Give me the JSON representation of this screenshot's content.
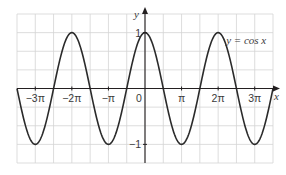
{
  "chart_data": {
    "type": "line",
    "title": "",
    "function": "cos",
    "series": [
      {
        "name": "y = cos x",
        "x_range_pi": [
          -3.5,
          3.5
        ],
        "amplitude": 1,
        "period_pi": 2
      }
    ],
    "annotation": "y = cos x",
    "xlabel": "x",
    "ylabel": "y",
    "xlim_pi": [
      -3.5,
      3.5
    ],
    "ylim": [
      -1.3333,
      1.3333
    ],
    "x_grid_step_pi": 0.5,
    "y_grid_step": 0.3333,
    "grid": true,
    "x_ticks": [
      {
        "value_pi": -3,
        "label": "−3π"
      },
      {
        "value_pi": -2,
        "label": "−2π"
      },
      {
        "value_pi": -1,
        "label": "−π"
      },
      {
        "value_pi": 1,
        "label": "π"
      },
      {
        "value_pi": 2,
        "label": "2π"
      },
      {
        "value_pi": 3,
        "label": "3π"
      }
    ],
    "y_ticks": [
      {
        "value": 1,
        "label": "1"
      },
      {
        "value": -1,
        "label": "−1"
      }
    ],
    "origin_label": "0",
    "colors": {
      "curve": "#2b2b2b",
      "grid": "#d4d4d4",
      "axis": "#231f20"
    }
  }
}
